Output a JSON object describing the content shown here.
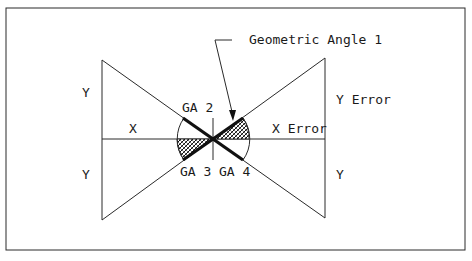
{
  "diagram": {
    "labels": {
      "callout": "Geometric Angle 1",
      "y_top_left": "Y",
      "y_bottom_left": "Y",
      "x_left": "X",
      "x_error": "X Error",
      "y_error": "Y Error",
      "y_bottom_right": "Y",
      "ga2": "GA 2",
      "ga3": "GA 3",
      "ga4": "GA 4"
    },
    "colors": {
      "line": "#2a2a2a",
      "thick_line": "#111111",
      "background": "#ffffff"
    }
  }
}
